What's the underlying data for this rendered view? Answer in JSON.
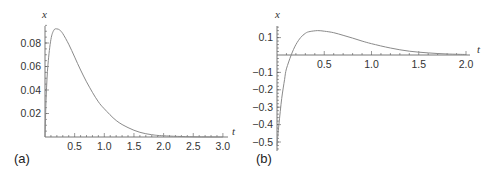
{
  "chart_data": [
    {
      "type": "line",
      "panel_label": "(a)",
      "title": "",
      "xlabel": "t",
      "ylabel": "x",
      "xlim": [
        0,
        3.0
      ],
      "ylim": [
        0,
        0.095
      ],
      "grid": false,
      "x_ticks": [
        "0.5",
        "1.0",
        "1.5",
        "2.0",
        "2.5",
        "3.0"
      ],
      "y_ticks": [
        "0.02",
        "0.04",
        "0.06",
        "0.08"
      ],
      "series": [
        {
          "name": "x(t)",
          "x": [
            0,
            0.02,
            0.05,
            0.1,
            0.15,
            0.2,
            0.25,
            0.3,
            0.4,
            0.5,
            0.6,
            0.7,
            0.8,
            0.9,
            1.0,
            1.2,
            1.4,
            1.6,
            1.8,
            2.0,
            2.5,
            3.0
          ],
          "values": [
            0,
            0.035,
            0.062,
            0.083,
            0.091,
            0.092,
            0.091,
            0.088,
            0.079,
            0.068,
            0.057,
            0.047,
            0.038,
            0.03,
            0.024,
            0.014,
            0.008,
            0.004,
            0.002,
            0.001,
            0.0002,
            0.0
          ]
        }
      ]
    },
    {
      "type": "line",
      "panel_label": "(b)",
      "title": "",
      "xlabel": "t",
      "ylabel": "x",
      "xlim": [
        0,
        2.0
      ],
      "ylim": [
        -0.55,
        0.16
      ],
      "grid": false,
      "x_ticks": [
        "0.5",
        "1.0",
        "1.5",
        "2.0"
      ],
      "y_ticks": [
        "0.1",
        "-0.1",
        "-0.2",
        "-0.3",
        "-0.4",
        "-0.5"
      ],
      "series": [
        {
          "name": "x(t)",
          "x": [
            0,
            0.02,
            0.05,
            0.08,
            0.1,
            0.15,
            0.2,
            0.25,
            0.3,
            0.35,
            0.43,
            0.5,
            0.6,
            0.7,
            0.8,
            0.9,
            1.0,
            1.2,
            1.4,
            1.6,
            1.8,
            2.0
          ],
          "values": [
            -0.52,
            -0.4,
            -0.25,
            -0.14,
            -0.08,
            0.0,
            0.06,
            0.1,
            0.125,
            0.135,
            0.14,
            0.137,
            0.128,
            0.113,
            0.097,
            0.08,
            0.065,
            0.04,
            0.022,
            0.012,
            0.006,
            0.003
          ]
        }
      ]
    }
  ]
}
